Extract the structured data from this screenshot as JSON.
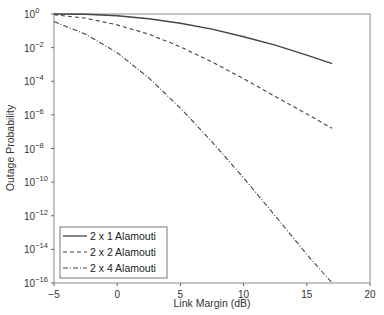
{
  "chart_data": {
    "type": "line",
    "title": "",
    "xlabel": "Link Margin (dB)",
    "ylabel": "Outage Probability",
    "xlim": [
      -5,
      20
    ],
    "ylim_log10": [
      -16,
      0
    ],
    "yscale": "log",
    "xticks": [
      "-5",
      "0",
      "5",
      "10",
      "15",
      "20"
    ],
    "yticks": [
      "10^0",
      "10^-2",
      "10^-4",
      "10^-6",
      "10^-8",
      "10^-10",
      "10^-12",
      "10^-14",
      "10^-16"
    ],
    "grid": false,
    "legend_position": "lower left",
    "x": [
      -5,
      -2.5,
      0,
      2.5,
      5,
      7.5,
      10,
      12.5,
      15,
      17
    ],
    "series": [
      {
        "name": "2 x 1 Alamouti",
        "style": "solid",
        "log10_values": [
          0,
          -0.02,
          -0.1,
          -0.28,
          -0.55,
          -0.9,
          -1.35,
          -1.85,
          -2.45,
          -2.95
        ]
      },
      {
        "name": "2 x 2 Alamouti",
        "style": "dashed",
        "log10_values": [
          -0.05,
          -0.25,
          -0.65,
          -1.2,
          -1.95,
          -2.85,
          -3.85,
          -4.9,
          -5.95,
          -6.8
        ]
      },
      {
        "name": "2 x 4 Alamouti",
        "style": "dash-dot",
        "log10_values": [
          -0.45,
          -1.2,
          -2.3,
          -3.8,
          -5.6,
          -7.6,
          -9.75,
          -12.0,
          -14.3,
          -16.0
        ]
      }
    ]
  },
  "legend": {
    "items": [
      "2 x 1 Alamouti",
      "2 x 2 Alamouti",
      "2 x 4 Alamouti"
    ]
  },
  "axes": {
    "xlabel": "Link Margin (dB)",
    "ylabel": "Outage Probability",
    "xtick_labels": [
      "−5",
      "0",
      "5",
      "10",
      "15",
      "20"
    ],
    "ytick_exponents": [
      "0",
      "−2",
      "−4",
      "−6",
      "−8",
      "−10",
      "−12",
      "−14",
      "−16"
    ]
  }
}
